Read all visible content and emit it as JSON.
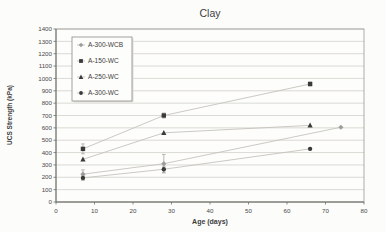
{
  "chart_data": {
    "type": "line",
    "title": "Clay",
    "xlabel": "Age (days)",
    "ylabel": "UCS Strength (kPa)",
    "xlim": [
      0,
      80
    ],
    "ylim": [
      0,
      1400
    ],
    "xticks": [
      0,
      10,
      20,
      30,
      40,
      50,
      60,
      70,
      80
    ],
    "yticks": [
      0,
      100,
      200,
      300,
      400,
      500,
      600,
      700,
      800,
      900,
      1000,
      1100,
      1200,
      1300,
      1400
    ],
    "grid": "horizontal",
    "legend_position": "top-left-inside",
    "series": [
      {
        "name": "A-300-WCB",
        "marker": "diamond",
        "marker_color": "#9d9d99",
        "line_color": "#c6c3bc",
        "points": [
          {
            "x": 7,
            "y": 225,
            "err": 35
          },
          {
            "x": 28,
            "y": 310,
            "err": 75
          },
          {
            "x": 74,
            "y": 605
          }
        ]
      },
      {
        "name": "A-150-WC",
        "marker": "square",
        "marker_color": "#3a3a3a",
        "line_color": "#c6c3bc",
        "points": [
          {
            "x": 7,
            "y": 430,
            "err": 40
          },
          {
            "x": 28,
            "y": 700,
            "err": 20
          },
          {
            "x": 66,
            "y": 955,
            "err": 15
          }
        ]
      },
      {
        "name": "A-250-WC",
        "marker": "triangle",
        "marker_color": "#3a3a3a",
        "line_color": "#c6c3bc",
        "points": [
          {
            "x": 7,
            "y": 345
          },
          {
            "x": 28,
            "y": 560
          },
          {
            "x": 66,
            "y": 620
          }
        ]
      },
      {
        "name": "A-300-WC",
        "marker": "circle",
        "marker_color": "#3a3a3a",
        "line_color": "#c6c3bc",
        "points": [
          {
            "x": 7,
            "y": 195,
            "err": 20
          },
          {
            "x": 28,
            "y": 265,
            "err": 25
          },
          {
            "x": 66,
            "y": 430
          }
        ]
      }
    ]
  },
  "colors": {
    "background": "#fcfcfb",
    "plot_background": "#fdfdfc",
    "gridline": "#cfcdc7",
    "plot_border": "#9a9892",
    "axis": "#6f6f6c",
    "tick_text": "#4a4a48",
    "title_text": "#3d3d3b",
    "legend_border": "#8a8a86",
    "legend_background": "#fdfdfc",
    "error_bar": "#a9a6a0"
  }
}
